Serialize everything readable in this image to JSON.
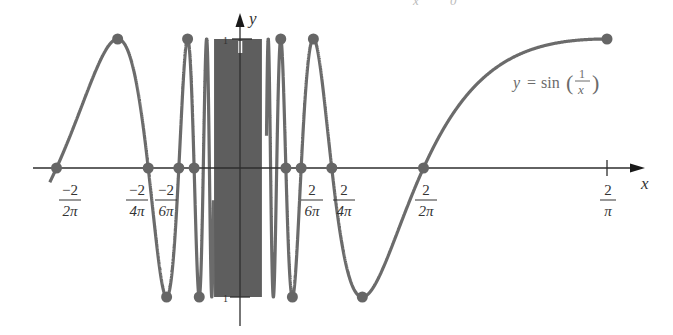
{
  "figure": {
    "top_fragment": {
      "left": "x",
      "right": "0"
    },
    "equation": {
      "lhs": "y",
      "equals": "=",
      "func": "sin",
      "numerator": "1",
      "denominator": "x"
    },
    "axes": {
      "x_label": "x",
      "y_label": "y",
      "y_tick_top": "1",
      "y_tick_bottom": "1"
    },
    "x_ticks": [
      {
        "num": "−2",
        "den": "2π",
        "value": -0.3183
      },
      {
        "num": "−2",
        "den": "4π",
        "value": -0.1592
      },
      {
        "num": "−2",
        "den": "6π",
        "value": -0.1061
      },
      {
        "num": "2",
        "den": "6π",
        "value": 0.1061
      },
      {
        "num": "2",
        "den": "4π",
        "value": 0.1592
      },
      {
        "num": "2",
        "den": "2π",
        "value": 0.3183
      },
      {
        "num": "2",
        "den": "π",
        "value": 0.6366
      }
    ]
  },
  "chart_data": {
    "type": "line",
    "title": "",
    "function": "y = sin(1/x)",
    "xlabel": "x",
    "ylabel": "y",
    "xlim": [
      -0.33,
      0.6366
    ],
    "ylim": [
      -1,
      1
    ],
    "grid": false,
    "legend": "none",
    "series": [
      {
        "name": "y = sin(1/x)",
        "x_range": [
          -0.33,
          0.6366
        ],
        "excluded": [
          0
        ]
      }
    ],
    "marked_points": {
      "zeros": [
        {
          "x": -0.3183,
          "y": 0
        },
        {
          "x": -0.1592,
          "y": 0
        },
        {
          "x": -0.1061,
          "y": 0
        },
        {
          "x": -0.0796,
          "y": 0
        },
        {
          "x": 0.0796,
          "y": 0
        },
        {
          "x": 0.1061,
          "y": 0
        },
        {
          "x": 0.1592,
          "y": 0
        },
        {
          "x": 0.3183,
          "y": 0
        }
      ],
      "maxima": [
        {
          "x": -0.2122,
          "y": 1
        },
        {
          "x": -0.0909,
          "y": 1
        },
        {
          "x": 0.0707,
          "y": 1
        },
        {
          "x": 0.1273,
          "y": 1
        },
        {
          "x": 0.6366,
          "y": 1
        }
      ],
      "minima": [
        {
          "x": -0.1273,
          "y": -1
        },
        {
          "x": -0.0707,
          "y": -1
        },
        {
          "x": 0.0909,
          "y": -1
        },
        {
          "x": 0.2122,
          "y": -1
        }
      ]
    },
    "x_tick_labels": [
      "−2/(2π)",
      "−2/(4π)",
      "−2/(6π)",
      "2/(6π)",
      "2/(4π)",
      "2/(2π)",
      "2/π"
    ],
    "y_tick_labels": [
      "1",
      "−1"
    ],
    "annotations": [
      "y = sin(1/x)"
    ]
  },
  "style": {
    "curve_color": "#6b6b6b",
    "dot_color": "#666666",
    "axis_color": "#2e2e2e",
    "origin_px": [
      240,
      168
    ],
    "scale_x_px": 576.5,
    "scale_y_px": 129
  }
}
